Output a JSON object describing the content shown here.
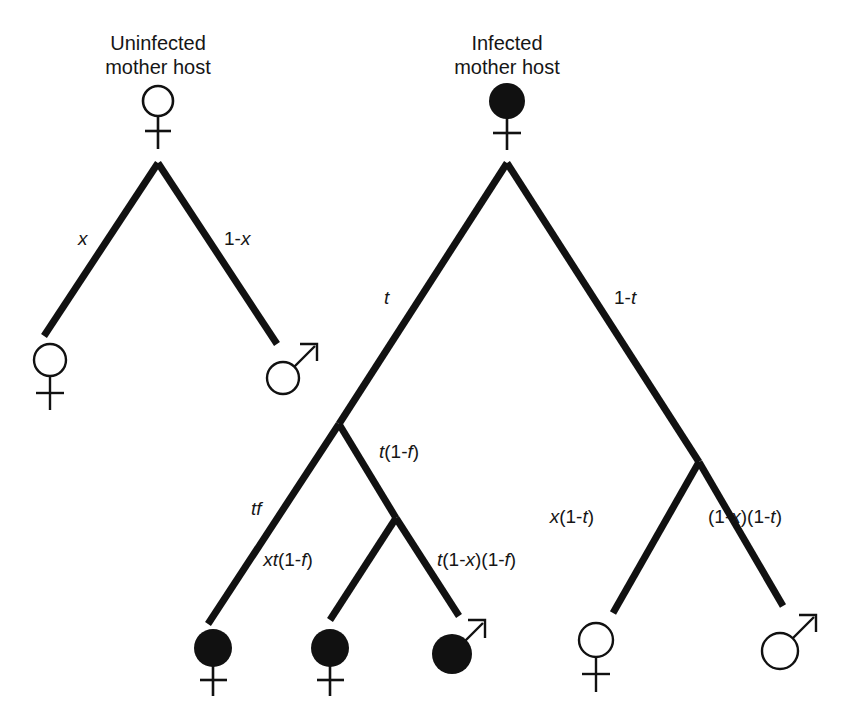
{
  "figure": {
    "type": "diagram",
    "subtype": "probability-tree",
    "background_color": "#ffffff",
    "line_color": "#111111",
    "text_color": "#161616"
  },
  "titles": {
    "left": {
      "line1": "Uninfected",
      "line2": "mother host"
    },
    "right": {
      "line1": "Infected",
      "line2": "mother host"
    }
  },
  "trees": {
    "left": {
      "root": {
        "symbol": "female",
        "state": "uninfected"
      },
      "branches": [
        {
          "label": "x",
          "italic_parts": "x",
          "to": "female-uninfected"
        },
        {
          "label": "1-x",
          "italic_parts": "x",
          "to": "male-uninfected"
        }
      ],
      "offspring": [
        {
          "symbol": "female",
          "state": "uninfected"
        },
        {
          "symbol": "male",
          "state": "uninfected"
        }
      ]
    },
    "right": {
      "root": {
        "symbol": "female",
        "state": "infected"
      },
      "branches": [
        {
          "label": "t",
          "to": "infected-subtree"
        },
        {
          "label": "1-t",
          "to": "uninfected-subtree"
        },
        {
          "label": "tf",
          "to": "female-infected"
        },
        {
          "label": "t(1-f)",
          "to": "inner-node"
        },
        {
          "label": "xt(1-f)",
          "to": "female-infected-2"
        },
        {
          "label": "t(1-x)(1-f)",
          "to": "male-infected"
        },
        {
          "label": "x(1-t)",
          "to": "female-uninfected"
        },
        {
          "label": "(1-x)(1-t)",
          "to": "male-uninfected"
        }
      ],
      "offspring": [
        {
          "symbol": "female",
          "state": "infected"
        },
        {
          "symbol": "female",
          "state": "infected"
        },
        {
          "symbol": "male",
          "state": "infected"
        },
        {
          "symbol": "female",
          "state": "uninfected"
        },
        {
          "symbol": "male",
          "state": "uninfected"
        }
      ]
    }
  },
  "labels": {
    "x": "x",
    "one_minus_x": "1-x",
    "t": "t",
    "one_minus_t": "1-t",
    "tf": "tf",
    "t_one_minus_f": "t(1-f)",
    "xt_one_minus_f": "xt(1-f)",
    "t_one_minus_x_one_minus_f": "t(1-x)(1-f)",
    "x_one_minus_t": "x(1-t)",
    "one_minus_x_one_minus_t": "(1-x)(1-t)"
  },
  "symbols": {
    "female_name": "female-symbol",
    "male_name": "male-symbol",
    "infected_fill": "#111111",
    "uninfected_fill": "#ffffff"
  }
}
